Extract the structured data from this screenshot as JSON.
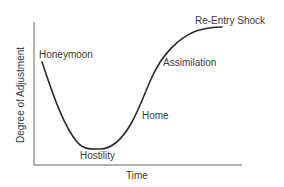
{
  "diagram": {
    "title": "",
    "type": "adjustment-curve",
    "axes": {
      "y_label": "Degree of Adjustment",
      "x_label": "Time"
    },
    "stages": [
      {
        "id": "honeymoon",
        "label": "Honeymoon"
      },
      {
        "id": "hostility",
        "label": "Hostility"
      },
      {
        "id": "home",
        "label": "Home"
      },
      {
        "id": "assimilation",
        "label": "Assimilation"
      },
      {
        "id": "re-entry-shock",
        "label": "Re-Entry Shock"
      }
    ],
    "colors": {
      "curve": "#2a2a2a",
      "axis": "#666666",
      "text": "#3a3a3a",
      "background": "#ffffff"
    }
  }
}
